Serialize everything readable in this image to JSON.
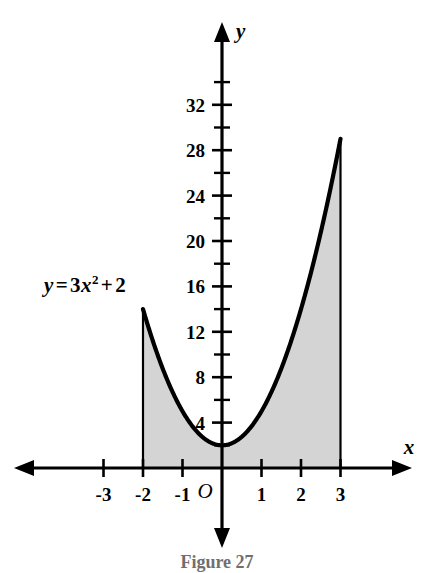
{
  "figure": {
    "caption": "Figure  27",
    "equation_label": {
      "lhs": "y",
      "equals": "=",
      "coefficient": "3",
      "variable": "x",
      "exponent": "2",
      "plus": "+",
      "constant": "2",
      "full_text": "y = 3x² + 2"
    },
    "axis_names": {
      "x": "x",
      "y": "y"
    },
    "origin_label": "O"
  },
  "chart_data": {
    "type": "area",
    "title": "",
    "subtitle": "",
    "xlabel": "x",
    "ylabel": "y",
    "function": "y = 3x^2 + 2",
    "curve_coefficients": {
      "a": 3,
      "b": 0,
      "c": 2
    },
    "shaded_region": {
      "description": "Area under the curve y = 3x^2 + 2 from x = -2 to x = 3",
      "x_from": -2,
      "x_to": 3,
      "fill_color": "#d4d4d4",
      "boundary_left_height": 14,
      "boundary_right_height": 29
    },
    "x": [
      -2,
      -1.5,
      -1,
      -0.5,
      0,
      0.5,
      1,
      1.5,
      2,
      2.5,
      3
    ],
    "values": [
      14,
      8.75,
      5,
      2.75,
      2,
      2.75,
      5,
      8.75,
      14,
      20.75,
      29
    ],
    "xlim": [
      -3.8,
      4.2
    ],
    "ylim": [
      -2.5,
      35.5
    ],
    "grid": false,
    "legend": "none",
    "x_ticks_major": [
      -3,
      -2,
      -1,
      0,
      1,
      2,
      3
    ],
    "x_tick_labels": [
      "-3",
      "-2",
      "-1",
      "O",
      "1",
      "2",
      "3"
    ],
    "y_ticks_major": [
      4,
      8,
      12,
      16,
      20,
      24,
      28,
      32
    ],
    "y_tick_labels": [
      "4",
      "8",
      "12",
      "16",
      "20",
      "24",
      "28",
      "32"
    ],
    "y_ticks_minor": [
      2,
      6,
      10,
      14,
      18,
      22,
      26,
      30,
      34
    ],
    "vertex": {
      "x": 0,
      "y": 2
    },
    "curve_color": "#000000",
    "axis_color": "#000000"
  }
}
